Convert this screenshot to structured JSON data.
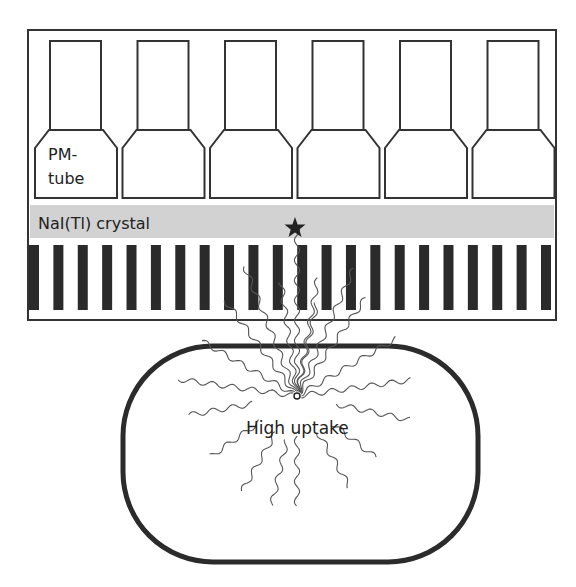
{
  "diagram": {
    "labels": {
      "pm_tube_line1": "PM-",
      "pm_tube_line2": "tube",
      "crystal": "NaI(Tl) crystal",
      "uptake": "High uptake"
    },
    "components": {
      "pm_tube_count": 6,
      "collimator_septa_count": 22,
      "detector_event_marker": "star"
    },
    "colors": {
      "outline": "#333333",
      "crystal_band": "#d2d2d2",
      "septa": "#2a2a2a",
      "rays": "#555555",
      "background": "#ffffff"
    }
  }
}
